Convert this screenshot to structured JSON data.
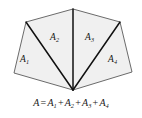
{
  "figure": {
    "kind": "geometry-diagram",
    "background_color": "#ffffff",
    "fill_color": "#f0f0f0",
    "outline_color": "#555555",
    "divider_color": "#111111",
    "polygon": {
      "vertices": [
        {
          "name": "top-apex",
          "x": 73,
          "y": 9
        },
        {
          "name": "upper-right",
          "x": 120,
          "y": 22
        },
        {
          "name": "lower-right",
          "x": 132,
          "y": 72
        },
        {
          "name": "bottom-apex",
          "x": 73,
          "y": 90
        },
        {
          "name": "lower-left",
          "x": 14,
          "y": 73
        },
        {
          "name": "upper-left",
          "x": 26,
          "y": 22
        }
      ]
    },
    "dividers": [
      {
        "name": "divider-to-upper-left",
        "from": "bottom-apex",
        "to": "upper-left"
      },
      {
        "name": "divider-to-top-apex",
        "from": "bottom-apex",
        "to": "top-apex"
      },
      {
        "name": "divider-to-upper-right",
        "from": "bottom-apex",
        "to": "upper-right"
      }
    ],
    "regions": [
      {
        "id": "a1",
        "label": "A",
        "subscript": "1"
      },
      {
        "id": "a2",
        "label": "A",
        "subscript": "2"
      },
      {
        "id": "a3",
        "label": "A",
        "subscript": "3"
      },
      {
        "id": "a4",
        "label": "A",
        "subscript": "4"
      }
    ]
  },
  "formula": {
    "lhs": "A",
    "equals": "=",
    "plus": "+",
    "terms": [
      {
        "base": "A",
        "sub": "1"
      },
      {
        "base": "A",
        "sub": "2"
      },
      {
        "base": "A",
        "sub": "3"
      },
      {
        "base": "A",
        "sub": "4"
      }
    ],
    "plain_text": "A = A1 + A2 + A3 + A4"
  }
}
